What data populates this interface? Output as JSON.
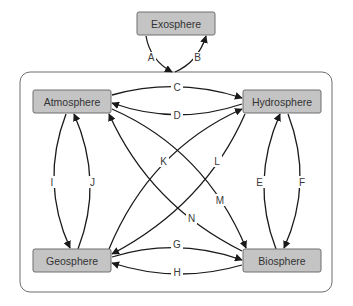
{
  "diagram": {
    "type": "flow",
    "nodes": {
      "exosphere": {
        "label": "Exosphere"
      },
      "atmosphere": {
        "label": "Atmosphere"
      },
      "hydrosphere": {
        "label": "Hydrosphere"
      },
      "geosphere": {
        "label": "Geosphere"
      },
      "biosphere": {
        "label": "Biosphere"
      }
    },
    "container": {
      "label": "Earth system (4 spheres)"
    },
    "edges": [
      {
        "id": "A",
        "label": "A",
        "from": "Exosphere",
        "to": "Earth system"
      },
      {
        "id": "B",
        "label": "B",
        "from": "Earth system",
        "to": "Exosphere"
      },
      {
        "id": "C",
        "label": "C",
        "from": "Atmosphere",
        "to": "Hydrosphere"
      },
      {
        "id": "D",
        "label": "D",
        "from": "Hydrosphere",
        "to": "Atmosphere"
      },
      {
        "id": "E",
        "label": "E",
        "from": "Biosphere",
        "to": "Hydrosphere"
      },
      {
        "id": "F",
        "label": "F",
        "from": "Hydrosphere",
        "to": "Biosphere"
      },
      {
        "id": "G",
        "label": "G",
        "from": "Geosphere",
        "to": "Biosphere"
      },
      {
        "id": "H",
        "label": "H",
        "from": "Biosphere",
        "to": "Geosphere"
      },
      {
        "id": "I",
        "label": "I",
        "from": "Atmosphere",
        "to": "Geosphere"
      },
      {
        "id": "J",
        "label": "J",
        "from": "Geosphere",
        "to": "Atmosphere"
      },
      {
        "id": "K",
        "label": "K",
        "from": "Geosphere",
        "to": "Hydrosphere"
      },
      {
        "id": "L",
        "label": "L",
        "from": "Hydrosphere",
        "to": "Geosphere"
      },
      {
        "id": "M",
        "label": "M",
        "from": "Atmosphere",
        "to": "Biosphere"
      },
      {
        "id": "N",
        "label": "N",
        "from": "Biosphere",
        "to": "Atmosphere"
      }
    ],
    "labels": {
      "A": "A",
      "B": "B",
      "C": "C",
      "D": "D",
      "E": "E",
      "F": "F",
      "G": "G",
      "H": "H",
      "I": "I",
      "J": "J",
      "K": "K",
      "L": "L",
      "M": "M",
      "N": "N"
    },
    "colors": {
      "node_fill": "#c4c4c4",
      "node_border": "#6e6e6e",
      "arrow": "#1a1a1a",
      "text": "#333333"
    }
  }
}
